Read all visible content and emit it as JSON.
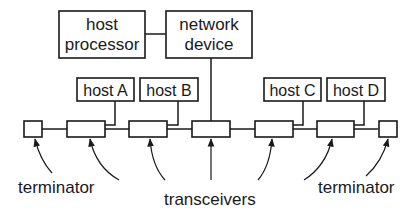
{
  "diagram": {
    "title": "",
    "nodes": {
      "host_processor": {
        "line1": "host",
        "line2": "processor"
      },
      "network_device": {
        "line1": "network",
        "line2": "device"
      },
      "host_a": {
        "label": "host A"
      },
      "host_b": {
        "label": "host B"
      },
      "host_c": {
        "label": "host C"
      },
      "host_d": {
        "label": "host D"
      }
    },
    "labels": {
      "terminator_left": "terminator",
      "transceivers": "transceivers",
      "terminator_right": "terminator"
    },
    "bus": {
      "components": [
        "terminator",
        "transceiver",
        "transceiver",
        "transceiver",
        "transceiver",
        "transceiver",
        "terminator"
      ]
    },
    "edges": [
      [
        "host processor",
        "network device"
      ],
      [
        "network device",
        "transceiver 3"
      ],
      [
        "host A",
        "transceiver 1"
      ],
      [
        "host B",
        "transceiver 2"
      ],
      [
        "host C",
        "transceiver 4"
      ],
      [
        "host D",
        "transceiver 5"
      ]
    ],
    "colors": {
      "ink": "#1a1a1a",
      "background": "#ffffff"
    }
  }
}
